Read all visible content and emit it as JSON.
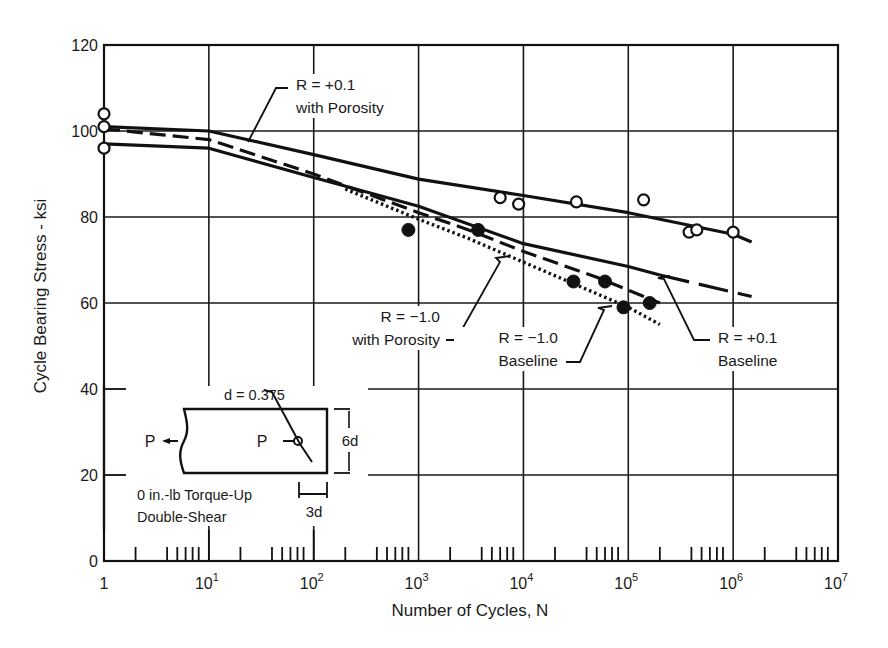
{
  "chart_data": {
    "type": "line",
    "title": "",
    "xlabel": "Number of Cycles, N",
    "ylabel": "Cycle Bearing Stress - ksi",
    "xscale": "log",
    "xlim": [
      1,
      10000000
    ],
    "ylim": [
      0,
      120
    ],
    "grid": true,
    "x_tick_labels": [
      {
        "base": "1",
        "exp": ""
      },
      {
        "base": "10",
        "exp": "1"
      },
      {
        "base": "10",
        "exp": "2"
      },
      {
        "base": "10",
        "exp": "3"
      },
      {
        "base": "10",
        "exp": "4"
      },
      {
        "base": "10",
        "exp": "5"
      },
      {
        "base": "10",
        "exp": "6"
      },
      {
        "base": "10",
        "exp": "7"
      }
    ],
    "y_tick_labels": [
      "0",
      "20",
      "40",
      "60",
      "80",
      "100",
      "120"
    ],
    "series": [
      {
        "name": "R = +0.1 with Porosity",
        "style": "solid",
        "x": [
          1,
          10,
          100,
          1000,
          10000,
          100000,
          1000000,
          1500000
        ],
        "y": [
          101,
          100,
          94.5,
          88.8,
          85,
          81,
          76,
          74.2
        ]
      },
      {
        "name": "R = +0.1 Baseline",
        "style": "solid-then-dashed",
        "x": [
          1,
          10,
          100,
          1000,
          10000,
          100000,
          200000,
          1500000
        ],
        "y": [
          97,
          96,
          89.2,
          82.5,
          73.8,
          68.5,
          66.5,
          61.5
        ]
      },
      {
        "name": "R = -1.0 with Porosity",
        "style": "dashed",
        "x": [
          1,
          10,
          100,
          1000,
          3000,
          10000,
          50000,
          100000,
          200000
        ],
        "y": [
          100.5,
          98,
          90,
          81,
          77,
          72,
          66,
          63,
          60
        ]
      },
      {
        "name": "R = -1.0 Baseline",
        "style": "dotted",
        "x": [
          200,
          1000,
          3000,
          10000,
          30000,
          100000,
          200000
        ],
        "y": [
          86.5,
          79.5,
          75,
          69.5,
          64.5,
          59,
          55
        ]
      }
    ],
    "points_open": {
      "name": "R = +0.1 data (open circles)",
      "x": [
        1,
        1,
        1,
        6000,
        9000,
        32000,
        140000,
        380000,
        450000,
        1000000
      ],
      "y": [
        104,
        101,
        96,
        84.5,
        83,
        83.5,
        84,
        76.5,
        77,
        76.5
      ]
    },
    "points_filled": {
      "name": "R = -1.0 data (filled circles)",
      "x": [
        800,
        3700,
        30000,
        60000,
        90000,
        160000
      ],
      "y": [
        77,
        77,
        65,
        65,
        59,
        60
      ]
    },
    "annotations": [
      {
        "lines": [
          "R = +0.1",
          "with Porosity"
        ],
        "points_to": "R = +0.1 with Porosity"
      },
      {
        "lines": [
          "R = −1.0",
          "with Porosity"
        ],
        "points_to": "R = -1.0 with Porosity"
      },
      {
        "lines": [
          "R = −1.0",
          "Baseline"
        ],
        "points_to": "R = -1.0 Baseline"
      },
      {
        "lines": [
          "R = +0.1",
          "Baseline"
        ],
        "points_to": "R = +0.1 Baseline"
      }
    ],
    "inset": {
      "diameter_label": "d = 0.375",
      "load_left": "P",
      "load_right": "P",
      "height_label": "6d",
      "edge_label": "3d",
      "caption_line1": "0 in.-lb Torque-Up",
      "caption_line2": "Double-Shear"
    }
  }
}
